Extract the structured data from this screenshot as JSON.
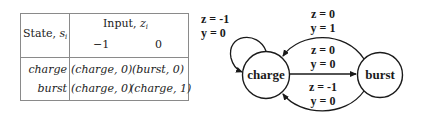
{
  "table": {
    "state_header": "State, ",
    "state_header_var": "s",
    "state_header_sub": "i",
    "input_header": "Input, ",
    "input_header_var": "z",
    "input_header_sub": "i",
    "input_columns": [
      "−1",
      "0"
    ],
    "rows": [
      {
        "state": "charge",
        "cells": [
          "(charge, 0)",
          "(burst, 0)"
        ]
      },
      {
        "state": "burst",
        "cells": [
          "(charge, 0)",
          "(charge, 1)"
        ]
      }
    ]
  },
  "diagram": {
    "nodes": [
      {
        "id": "charge",
        "label": "charge"
      },
      {
        "id": "burst",
        "label": "burst"
      }
    ],
    "edges": [
      {
        "from": "charge",
        "to": "charge",
        "z_label": "z = -1",
        "y_label": "y = 0"
      },
      {
        "from": "burst",
        "to": "charge",
        "z_label": "z = 0",
        "y_label": "y = 1"
      },
      {
        "from": "charge",
        "to": "burst",
        "z_label": "z = 0",
        "y_label": "y = 0"
      },
      {
        "from": "burst",
        "to": "charge",
        "z_label": "z = -1",
        "y_label": "y = 0"
      }
    ]
  }
}
